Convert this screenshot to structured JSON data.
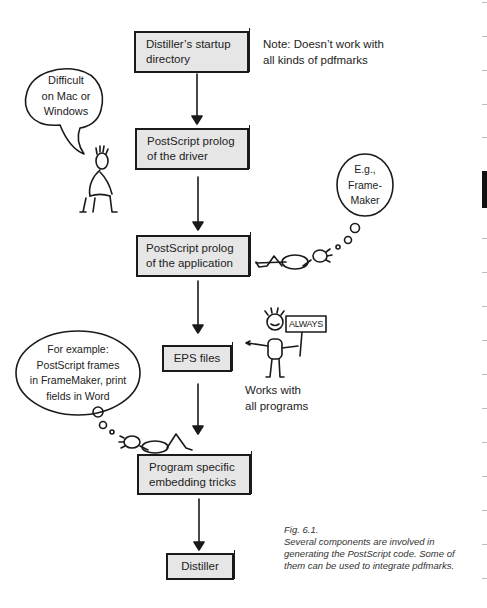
{
  "flow": {
    "boxes": [
      {
        "id": "startup",
        "label_line1": "Distiller’s startup",
        "label_line2": "directory"
      },
      {
        "id": "driver",
        "label_line1": "PostScript prolog",
        "label_line2": "of the driver"
      },
      {
        "id": "application",
        "label_line1": "PostScript prolog",
        "label_line2": "of the application"
      },
      {
        "id": "eps",
        "label_line1": "EPS files"
      },
      {
        "id": "tricks",
        "label_line1": "Program specific",
        "label_line2": "embedding tricks"
      },
      {
        "id": "distiller",
        "label_line1": "Distiller"
      }
    ]
  },
  "notes": {
    "startup_note_line1": "Note: Doesn’t work with",
    "startup_note_line2": "all kinds of pdfmarks",
    "eps_note_line1": "Works with",
    "eps_note_line2": "all programs"
  },
  "bubbles": {
    "difficult": [
      "Difficult",
      "on Mac or",
      "Windows"
    ],
    "framemaker": [
      "E.g.,",
      "Frame-",
      "Maker"
    ],
    "example": [
      "For example:",
      "PostScript frames",
      "in FrameMaker, print",
      "fields in Word"
    ],
    "sign": "ALWAYS"
  },
  "caption": {
    "figure": "Fig. 6.1.",
    "line1": "Several components are involved in",
    "line2": "generating the PostScript code. Some of",
    "line3": "them can be used to integrate pdfmarks."
  },
  "colors": {
    "box_fill": "#e6e6e6",
    "ink": "#1a1a1a",
    "margin_tab": "#111111"
  }
}
